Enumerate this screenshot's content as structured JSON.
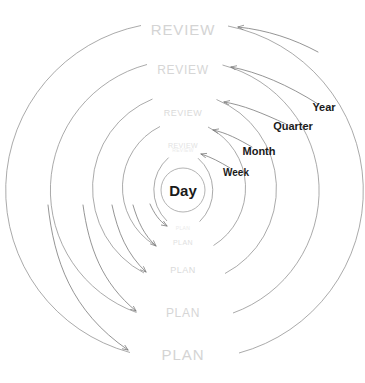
{
  "diagram": {
    "type": "concentric-cycle-diagram",
    "center": {
      "x": 183,
      "y": 190
    },
    "colors": {
      "ring_stroke": "#8a8a8a",
      "arrow_stroke": "#7a7a7a",
      "faint_text": "#e8e8e8",
      "light_text": "#dcdcdc",
      "mid_text": "#d0d0d0",
      "bold_text": "#1a1a1a",
      "background": "#ffffff"
    },
    "center_node": {
      "label": "Day",
      "x": 183,
      "y": 190,
      "font_size": 15,
      "color": "#1a1a1a"
    },
    "cycles": [
      {
        "name": "week",
        "label": "Week",
        "radius": 43,
        "review_label": "REVIEW",
        "plan_label": "PLAN",
        "review_x": 183,
        "review_y": 150,
        "plan_x": 183,
        "plan_y": 228,
        "label_x": 236,
        "label_y": 172,
        "ring_font_size": 5,
        "ring_color": "#e9e9e9",
        "cycle_font_size": 10
      },
      {
        "name": "month",
        "label": "Month",
        "radius": 68,
        "review_label": "REVIEW",
        "plan_label": "PLAN",
        "review_x": 183,
        "review_y": 145,
        "plan_x": 183,
        "plan_y": 242,
        "label_x": 259,
        "label_y": 151,
        "ring_font_size": 7,
        "ring_color": "#e2e2e2",
        "cycle_font_size": 11
      },
      {
        "name": "quarter",
        "label": "Quarter",
        "radius": 96,
        "review_label": "REVIEW",
        "plan_label": "PLAN",
        "review_x": 183,
        "review_y": 113,
        "plan_x": 183,
        "plan_y": 270,
        "label_x": 293,
        "label_y": 126,
        "ring_font_size": 9,
        "ring_color": "#dadada",
        "cycle_font_size": 11
      },
      {
        "name": "year",
        "label": "Year",
        "radius": 130,
        "review_label": "REVIEW",
        "plan_label": "PLAN",
        "review_x": 183,
        "review_y": 70,
        "plan_x": 183,
        "plan_y": 313,
        "label_x": 324,
        "label_y": 107,
        "ring_font_size": 12,
        "ring_color": "#d6d6d6",
        "cycle_font_size": 11
      },
      {
        "name": "outer",
        "label": "",
        "radius": 168,
        "review_label": "REVIEW",
        "plan_label": "PLAN",
        "review_x": 183,
        "review_y": 29,
        "plan_x": 183,
        "plan_y": 354,
        "label_x": 0,
        "label_y": 0,
        "ring_font_size": 15,
        "ring_color": "#d4d4d4",
        "cycle_font_size": 0
      }
    ],
    "inner_ring": {
      "radius": 22,
      "note": "innermost circle around Day"
    },
    "flow": {
      "left_direction": "plan-downward-arrows",
      "right_direction": "review-upward-arrows"
    }
  }
}
